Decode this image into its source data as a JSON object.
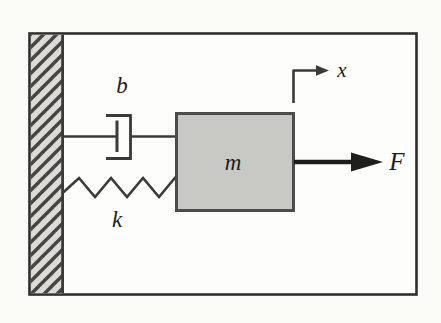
{
  "figure": {
    "type": "mass-spring-damper free-body diagram",
    "labels": {
      "damper": "b",
      "spring": "k",
      "mass": "m",
      "displacement": "x",
      "force": "F"
    }
  },
  "colors": {
    "background": "#fafaf7",
    "frame_border": "#2e2e2c",
    "paper": "#fdfdfb",
    "wall_fill": "#dcdbd6",
    "hatch": "#454543",
    "line": "#3a3a38",
    "mass_fill": "#c8c8c4",
    "mass_border": "#4c4c4a",
    "arrow": "#1e1e1c",
    "label": "#1c1c1a"
  }
}
